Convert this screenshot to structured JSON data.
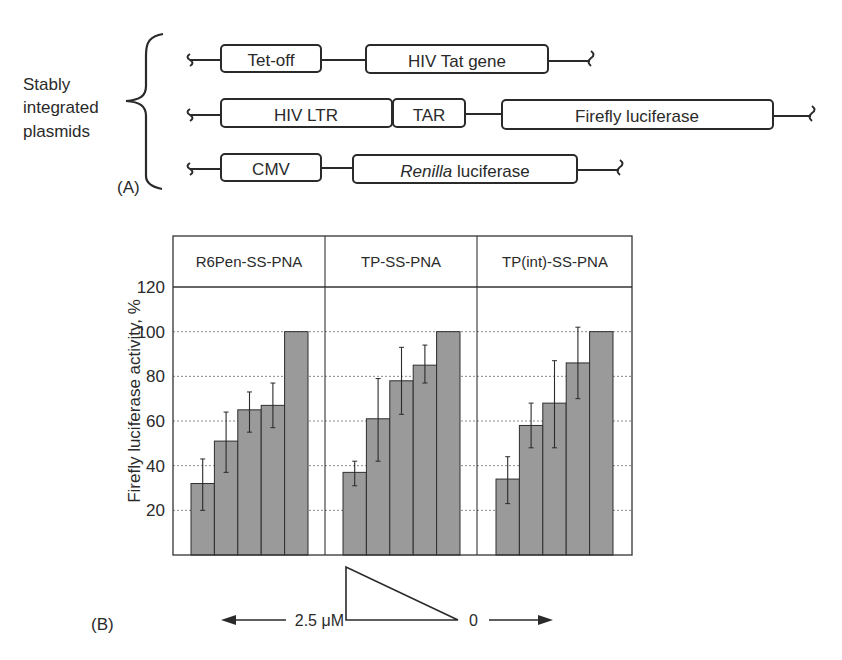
{
  "panel_a": {
    "panel_label": "(A)",
    "group_label": [
      "Stably",
      "integrated",
      "plasmids"
    ],
    "constructs": [
      {
        "elements": [
          {
            "label": "Tet-off",
            "italic_part": ""
          },
          {
            "label": "HIV Tat gene",
            "italic_part": ""
          }
        ]
      },
      {
        "elements": [
          {
            "label": "HIV LTR",
            "italic_part": ""
          },
          {
            "label": "TAR",
            "italic_part": ""
          },
          {
            "label": "Firefly luciferase",
            "italic_part": ""
          }
        ]
      },
      {
        "elements": [
          {
            "label": "CMV",
            "italic_part": ""
          },
          {
            "label": " luciferase",
            "italic_part": "Renilla"
          }
        ]
      }
    ]
  },
  "panel_b": {
    "panel_label": "(B)",
    "concentration_high": "2.5 μM",
    "concentration_low": "0"
  },
  "chart_data": {
    "type": "bar",
    "title": "",
    "xlabel": "",
    "ylabel": "Firefly luciferase activity, %",
    "ylim": [
      0,
      120
    ],
    "yticks": [
      20,
      40,
      60,
      80,
      100,
      120
    ],
    "grid": "horizontal dotted",
    "legend": "none",
    "facets": [
      "R6Pen-SS-PNA",
      "TP-SS-PNA",
      "TP(int)-SS-PNA"
    ],
    "x_annotation": "concentration gradient 2.5 μM → 0 (left to right)",
    "series": [
      {
        "name": "R6Pen-SS-PNA",
        "values": [
          32,
          51,
          65,
          67,
          100
        ],
        "error_low": [
          20,
          37,
          55,
          57,
          null
        ],
        "error_high": [
          43,
          64,
          73,
          77,
          null
        ]
      },
      {
        "name": "TP-SS-PNA",
        "values": [
          37,
          61,
          78,
          85,
          100
        ],
        "error_low": [
          31,
          42,
          63,
          77,
          null
        ],
        "error_high": [
          42,
          79,
          93,
          94,
          null
        ]
      },
      {
        "name": "TP(int)-SS-PNA",
        "values": [
          34,
          58,
          68,
          86,
          100
        ],
        "error_low": [
          23,
          48,
          48,
          70,
          null
        ],
        "error_high": [
          44,
          68,
          87,
          102,
          null
        ]
      }
    ],
    "colors": {
      "bar": "#9a9a9a",
      "bar_edge": "#2e2e2e",
      "grid": "#8a8a8a",
      "frame": "#333333"
    }
  }
}
